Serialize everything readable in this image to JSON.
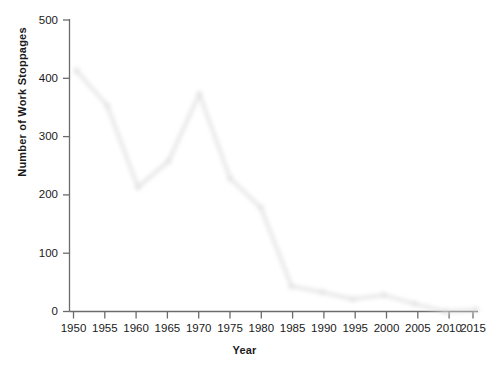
{
  "chart_data": {
    "type": "line",
    "title": "",
    "xlabel": "Year",
    "ylabel": "Number of Work Stoppages",
    "x": [
      1950,
      1955,
      1960,
      1965,
      1970,
      1975,
      1980,
      1985,
      1990,
      1995,
      2000,
      2005,
      2010,
      2015
    ],
    "values": [
      420,
      360,
      220,
      265,
      380,
      235,
      185,
      50,
      40,
      28,
      35,
      20,
      7,
      10
    ],
    "categories": [
      "1950",
      "1955",
      "1960",
      "1965",
      "1970",
      "1975",
      "1980",
      "1985",
      "1990",
      "1995",
      "2000",
      "2005",
      "2010",
      "2015"
    ],
    "xticklabels": [
      "1950",
      "1955",
      "1960",
      "1965",
      "1970",
      "1975",
      "1980",
      "1985",
      "1990",
      "1995",
      "2000",
      "2005",
      "2010",
      "2015"
    ],
    "yticklabels": [
      "0",
      "100",
      "200",
      "300",
      "400",
      "500"
    ],
    "yticks": [
      0,
      100,
      200,
      300,
      400,
      500
    ],
    "ylim": [
      0,
      500
    ],
    "xlim": [
      1950,
      2015
    ],
    "grid": false,
    "legend": null,
    "series_color": "#1a1a1a",
    "marker": "circle",
    "line_width": 3
  },
  "axes": {
    "y_title": "Number of Work Stoppages",
    "x_title": "Year"
  },
  "yticks": {
    "t0": "0",
    "t1": "100",
    "t2": "200",
    "t3": "300",
    "t4": "400",
    "t5": "500"
  },
  "xticks": {
    "t0": "1950",
    "t1": "1955",
    "t2": "1960",
    "t3": "1965",
    "t4": "1970",
    "t5": "1975",
    "t6": "1980",
    "t7": "1985",
    "t8": "1990",
    "t9": "1995",
    "t10": "2000",
    "t11": "2005",
    "t12": "2010",
    "t13": "2015"
  },
  "colors": {
    "line": "#1a1a1a",
    "axis": "#6b6b6b",
    "text": "#1a1a1a",
    "background": "#ffffff",
    "shadow": "#cfcfcf"
  }
}
